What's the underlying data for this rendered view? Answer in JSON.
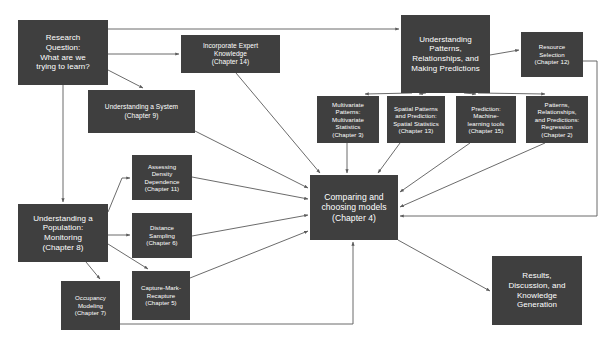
{
  "diagram": {
    "background_color": "#ffffff",
    "node_fill": "#3f3f3f",
    "node_text_color": "#ffffff",
    "edge_color": "#5a5a5a",
    "canvas": {
      "width": 612,
      "height": 351
    },
    "nodes": [
      {
        "id": "research-question",
        "label": "Research\nQuestion:\nWhat are we\ntrying to learn?",
        "x": 18,
        "y": 20,
        "w": 90,
        "h": 65,
        "size": "n-md"
      },
      {
        "id": "incorporate-expert-knowledge",
        "label": "Incorporate Expert\nKnowledge\n(Chapter 14)",
        "x": 181,
        "y": 35,
        "w": 99,
        "h": 38,
        "size": "n-sm"
      },
      {
        "id": "understanding-a-system",
        "label": "Understanding a System\n(Chapter 9)",
        "x": 88,
        "y": 90,
        "w": 107,
        "h": 43,
        "size": "n-sm"
      },
      {
        "id": "understanding-patterns",
        "label": "Understanding\nPatterns,\nRelationships, and\nMaking Predictions",
        "x": 401,
        "y": 15,
        "w": 89,
        "h": 78,
        "size": "n-md"
      },
      {
        "id": "resource-selection",
        "label": "Resource\nSelection\n(Chapter 12)",
        "x": 521,
        "y": 32,
        "w": 62,
        "h": 45,
        "size": "n-xs"
      },
      {
        "id": "multivariate-patterns",
        "label": "Multivariate\nPatterns:\nMultivariate\nStatistics\n(Chapter 3)",
        "x": 317,
        "y": 96,
        "w": 62,
        "h": 47,
        "size": "n-xs"
      },
      {
        "id": "spatial-patterns",
        "label": "Spatial Patterns\nand Prediction:\nSpatial Statistics\n(Chapter 13)",
        "x": 387,
        "y": 96,
        "w": 58,
        "h": 47,
        "size": "n-xs"
      },
      {
        "id": "prediction-machine-learning",
        "label": "Prediction:\nMachine-\nlearning tools\n(Chapter 15)",
        "x": 456,
        "y": 96,
        "w": 60,
        "h": 47,
        "size": "n-xs"
      },
      {
        "id": "patterns-regression",
        "label": "Patterns,\nRelationships,\nand Predictions:\nRegression\n(Chapter 2)",
        "x": 526,
        "y": 96,
        "w": 62,
        "h": 47,
        "size": "n-xs"
      },
      {
        "id": "assessing-density-dependence",
        "label": "Assessing\nDensity\nDependence\n(Chapter 11)",
        "x": 132,
        "y": 155,
        "w": 60,
        "h": 45,
        "size": "n-xs"
      },
      {
        "id": "distance-sampling",
        "label": "Distance\nSampling\n(Chapter 6)",
        "x": 132,
        "y": 213,
        "w": 60,
        "h": 45,
        "size": "n-xs"
      },
      {
        "id": "capture-mark-recapture",
        "label": "Capture-Mark-\nRecapture\n(Chapter 5)",
        "x": 132,
        "y": 271,
        "w": 58,
        "h": 49,
        "size": "n-xs"
      },
      {
        "id": "understanding-a-population",
        "label": "Understanding a\nPopulation:\nMonitoring\n(Chapter 8)",
        "x": 18,
        "y": 204,
        "w": 90,
        "h": 58,
        "size": "n-md"
      },
      {
        "id": "occupancy-modeling",
        "label": "Occupancy\nModeling\n(Chapter 7)",
        "x": 61,
        "y": 281,
        "w": 59,
        "h": 49,
        "size": "n-xs"
      },
      {
        "id": "comparing-choosing-models",
        "label": "Comparing and\nchoosing models\n(Chapter 4)",
        "x": 310,
        "y": 175,
        "w": 88,
        "h": 65,
        "size": "n-lg"
      },
      {
        "id": "results-discussion",
        "label": "Results,\nDiscussion, and\nKnowledge\nGeneration",
        "x": 492,
        "y": 256,
        "w": 90,
        "h": 69,
        "size": "n-md"
      }
    ],
    "edges": [
      {
        "from": "research-question",
        "to": "understanding-patterns",
        "path": "M 108,29 L 399,29",
        "arrow": true
      },
      {
        "from": "research-question",
        "to": "incorporate-expert-knowledge",
        "path": "M 108,54 L 179,54",
        "arrow": true
      },
      {
        "from": "research-question",
        "to": "understanding-a-system",
        "path": "M 108,70 L 143,88",
        "arrow": true
      },
      {
        "from": "research-question",
        "to": "understanding-a-population",
        "path": "M 63,85 L 63,202",
        "arrow": true
      },
      {
        "from": "incorporate-expert-knowledge",
        "to": "comparing-choosing-models",
        "path": "M 236,73 L 320,173",
        "arrow": true
      },
      {
        "from": "understanding-a-system",
        "to": "comparing-choosing-models",
        "path": "M 195,131 L 308,188",
        "arrow": true
      },
      {
        "from": "understanding-patterns",
        "to": "resource-selection",
        "path": "M 490,55 L 519,50",
        "arrow": true
      },
      {
        "from": "understanding-patterns",
        "to": "multivariate-patterns",
        "path": "M 412,93 L 365,94",
        "arrow": true
      },
      {
        "from": "understanding-patterns",
        "to": "spatial-patterns",
        "path": "M 426,93 L 419,94",
        "arrow": true
      },
      {
        "from": "understanding-patterns",
        "to": "prediction-machine-learning",
        "path": "M 464,93 L 476,94",
        "arrow": true
      },
      {
        "from": "understanding-patterns",
        "to": "patterns-regression",
        "path": "M 478,93 L 545,94",
        "arrow": true
      },
      {
        "from": "multivariate-patterns",
        "to": "comparing-choosing-models",
        "path": "M 347,143 L 347,173",
        "arrow": true
      },
      {
        "from": "spatial-patterns",
        "to": "comparing-choosing-models",
        "path": "M 400,143 L 378,173",
        "arrow": true
      },
      {
        "from": "prediction-machine-learning",
        "to": "comparing-choosing-models",
        "path": "M 470,143 L 400,192",
        "arrow": true
      },
      {
        "from": "patterns-regression",
        "to": "comparing-choosing-models",
        "path": "M 545,143 L 400,207",
        "arrow": true
      },
      {
        "from": "resource-selection",
        "to": "comparing-choosing-models",
        "path": "M 583,61 L 597,61 L 597,216 L 400,216",
        "arrow": true
      },
      {
        "from": "understanding-a-population",
        "to": "assessing-density-dependence",
        "path": "M 108,212 L 122,178 L 130,178",
        "arrow": true
      },
      {
        "from": "understanding-a-population",
        "to": "distance-sampling",
        "path": "M 108,235 L 130,235",
        "arrow": true
      },
      {
        "from": "understanding-a-population",
        "to": "capture-mark-recapture",
        "path": "M 108,244 L 148,269",
        "arrow": true
      },
      {
        "from": "understanding-a-population",
        "to": "occupancy-modeling",
        "path": "M 86,262 L 100,279",
        "arrow": true
      },
      {
        "from": "assessing-density-dependence",
        "to": "comparing-choosing-models",
        "path": "M 192,177 L 308,199",
        "arrow": true
      },
      {
        "from": "distance-sampling",
        "to": "comparing-choosing-models",
        "path": "M 192,236 L 308,215",
        "arrow": true
      },
      {
        "from": "capture-mark-recapture",
        "to": "comparing-choosing-models",
        "path": "M 190,278 L 308,231",
        "arrow": true
      },
      {
        "from": "occupancy-modeling",
        "to": "comparing-choosing-models",
        "path": "M 120,324 L 353,324 L 353,242",
        "arrow": true
      },
      {
        "from": "comparing-choosing-models",
        "to": "results-discussion",
        "path": "M 398,240 L 490,291",
        "arrow": true
      }
    ]
  }
}
